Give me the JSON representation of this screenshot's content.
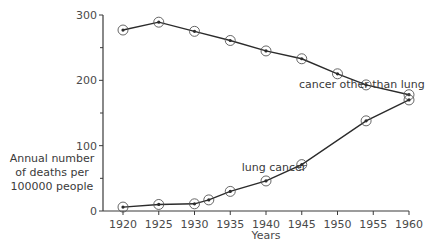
{
  "chart_data": {
    "type": "line",
    "title": "",
    "xlabel": "Years",
    "ylabel": [
      "Annual number",
      "of deaths per",
      "100000 people"
    ],
    "xlim": [
      1917,
      1961
    ],
    "ylim": [
      0,
      300
    ],
    "x_ticks": [
      1920,
      1925,
      1930,
      1935,
      1940,
      1945,
      1950,
      1955,
      1960
    ],
    "y_ticks": [
      0,
      100,
      200,
      300
    ],
    "y_minor_ticks": [
      50,
      150,
      250
    ],
    "grid": false,
    "legend": "inline labels",
    "series": [
      {
        "name": "cancer other than lung",
        "x": [
          1920,
          1925,
          1930,
          1935,
          1940,
          1945,
          1950,
          1954,
          1960
        ],
        "values": [
          277,
          289,
          275,
          261,
          245,
          233,
          210,
          193,
          178
        ]
      },
      {
        "name": "lung cancer",
        "x": [
          1920,
          1925,
          1930,
          1932,
          1935,
          1940,
          1945,
          1954,
          1960
        ],
        "values": [
          6,
          10,
          11,
          17,
          30,
          46,
          71,
          138,
          170
        ]
      }
    ],
    "annotations": [
      {
        "text": "cancer other than lung",
        "x": 1946,
        "y": 195
      },
      {
        "text": "lung cancer",
        "x": 1938,
        "y": 68
      }
    ]
  },
  "colors": {
    "line": "#2b2b2b",
    "axis": "#3a3a3a",
    "marker_ring": "#555555",
    "text": "#3a3a3a"
  }
}
